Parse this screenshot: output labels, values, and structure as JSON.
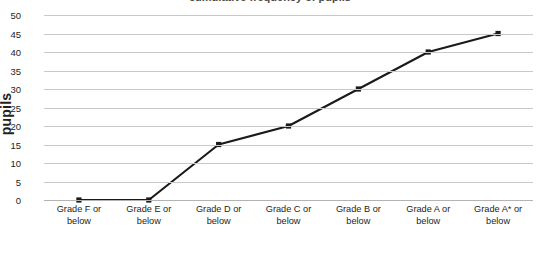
{
  "chart_data": {
    "type": "line",
    "title": "",
    "xlabel": "",
    "ylabel": "pupils",
    "ylim": [
      0,
      50
    ],
    "ytick_step": 5,
    "yticks": [
      50,
      45,
      40,
      35,
      30,
      25,
      20,
      15,
      10,
      5,
      0
    ],
    "grid": true,
    "legend": "none",
    "categories": [
      "Grade F or below",
      "Grade E or below",
      "Grade D or below",
      "Grade C or below",
      "Grade B or below",
      "Grade A or below",
      "Grade A* or below"
    ],
    "categories_line1": [
      "Grade F or",
      "Grade E or",
      "Grade D or",
      "Grade C or",
      "Grade B or",
      "Grade A or",
      "Grade A* or"
    ],
    "categories_line2": [
      "below",
      "below",
      "below",
      "below",
      "below",
      "below",
      "below"
    ],
    "values": [
      0,
      0,
      15,
      20,
      30,
      40,
      45
    ],
    "series": [
      {
        "name": "pupils",
        "values": [
          0,
          0,
          15,
          20,
          30,
          40,
          45
        ],
        "line_color": "#1a1a1a",
        "marker": "square",
        "marker_color": "#1a1a1a"
      }
    ]
  },
  "axes": {
    "y_title": "pupils",
    "y_tick_labels": [
      "50",
      "45",
      "40",
      "35",
      "30",
      "25",
      "20",
      "15",
      "10",
      "5",
      "0"
    ],
    "gridline_color": "#c9c9c9",
    "baseline_color": "#b3b3b3"
  },
  "title_sliver": "cumulative frequency of pupils",
  "colors": {
    "background": "#ffffff",
    "text": "#231f20",
    "line": "#1a1a1a",
    "grid": "#c9c9c9"
  }
}
